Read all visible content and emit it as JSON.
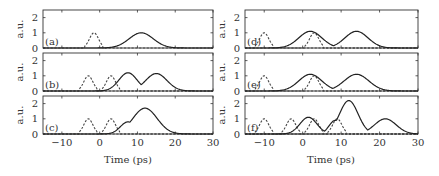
{
  "chart_data": {
    "type": "line",
    "xlabel": "Time (ps)",
    "ylabel": "a.u.",
    "xlim": [
      -15,
      30
    ],
    "ylim": [
      0,
      2.5
    ],
    "xticks": [
      -10,
      0,
      10,
      20,
      30
    ],
    "yticks": [
      0,
      1,
      2
    ],
    "grid": false,
    "legend": "none",
    "panels": [
      {
        "label": "(a)",
        "column": "left",
        "row": 0,
        "dashed": [
          {
            "center": -1.5,
            "amp": 1.0,
            "width": 1.2
          }
        ],
        "solid": [
          {
            "center": 11,
            "amp": 1.0,
            "width": 3.2
          }
        ]
      },
      {
        "label": "(b)",
        "column": "left",
        "row": 1,
        "dashed": [
          {
            "center": -3,
            "amp": 1.0,
            "width": 1.2
          },
          {
            "center": 3,
            "amp": 1.0,
            "width": 1.2
          }
        ],
        "solid": [
          {
            "center": 7.5,
            "amp": 1.2,
            "width": 2.4
          },
          {
            "center": 15,
            "amp": 1.15,
            "width": 2.8
          }
        ]
      },
      {
        "label": "(c)",
        "column": "left",
        "row": 2,
        "dashed": [
          {
            "center": -3,
            "amp": 1.0,
            "width": 1.2
          },
          {
            "center": 3,
            "amp": 1.0,
            "width": 1.2
          }
        ],
        "solid": [
          {
            "center": 7.5,
            "amp": 0.8,
            "width": 2.0
          },
          {
            "center": 12,
            "amp": 1.7,
            "width": 3.2
          }
        ]
      },
      {
        "label": "(d)",
        "column": "right",
        "row": 0,
        "dashed": [
          {
            "center": -10,
            "amp": 1.0,
            "width": 1.2
          },
          {
            "center": 3,
            "amp": 1.0,
            "width": 1.2
          }
        ],
        "solid": [
          {
            "center": 2,
            "amp": 1.1,
            "width": 3.0
          },
          {
            "center": 14,
            "amp": 1.1,
            "width": 3.0
          }
        ]
      },
      {
        "label": "(e)",
        "column": "right",
        "row": 1,
        "dashed": [
          {
            "center": -10,
            "amp": 1.0,
            "width": 1.2
          },
          {
            "center": 3,
            "amp": 1.0,
            "width": 1.2
          }
        ],
        "solid": [
          {
            "center": 2,
            "amp": 1.1,
            "width": 3.0
          },
          {
            "center": 14,
            "amp": 1.1,
            "width": 3.2
          }
        ]
      },
      {
        "label": "(f)",
        "column": "right",
        "row": 2,
        "dashed": [
          {
            "center": -10,
            "amp": 1.0,
            "width": 1.2
          },
          {
            "center": -3,
            "amp": 1.0,
            "width": 1.2
          },
          {
            "center": 3,
            "amp": 1.0,
            "width": 1.2
          },
          {
            "center": 9,
            "amp": 1.0,
            "width": 1.2
          }
        ],
        "solid": [
          {
            "center": 1.5,
            "amp": 1.1,
            "width": 2.2
          },
          {
            "center": 8.5,
            "amp": 0.9,
            "width": 1.6
          },
          {
            "center": 12,
            "amp": 2.2,
            "width": 2.4
          },
          {
            "center": 21.5,
            "amp": 1.0,
            "width": 2.8
          }
        ]
      }
    ]
  }
}
